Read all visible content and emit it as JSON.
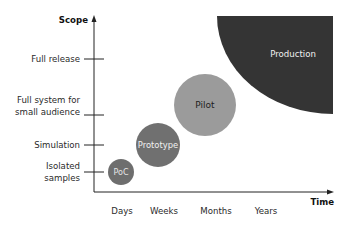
{
  "axes": {
    "y_label": "Scope",
    "x_label": "Time",
    "y_ticks": [
      {
        "label_lines": [
          "Full release"
        ],
        "y": 59
      },
      {
        "label_lines": [
          "Full system for",
          "small audience"
        ],
        "y": 115
      },
      {
        "label_lines": [
          "Simulation"
        ],
        "y": 145
      },
      {
        "label_lines": [
          "Isolated",
          "samples"
        ],
        "y": 172
      }
    ],
    "x_ticks": [
      {
        "label": "Days",
        "x": 122
      },
      {
        "label": "Weeks",
        "x": 164
      },
      {
        "label": "Months",
        "x": 216
      },
      {
        "label": "Years",
        "x": 266
      }
    ]
  },
  "stages": [
    {
      "name": "PoC",
      "cx": 121,
      "cy": 172,
      "r": 13,
      "fill": "#6e6e6e",
      "text_color": "#e6e6e6"
    },
    {
      "name": "Prototype",
      "cx": 158,
      "cy": 145,
      "r": 22,
      "fill": "#707070",
      "text_color": "#f2f2f2"
    },
    {
      "name": "Pilot",
      "cx": 205,
      "cy": 105,
      "r": 31,
      "fill": "#9b9b9b",
      "text_color": "#1e1e1e"
    },
    {
      "name": "Production",
      "fill": "#343434",
      "text_color": "#e8e8e8"
    }
  ],
  "labels": {
    "y_axis": "Scope",
    "x_axis": "Time",
    "tick_full_release": "Full release",
    "tick_full_system_1": "Full system for",
    "tick_full_system_2": "small audience",
    "tick_simulation": "Simulation",
    "tick_isolated_1": "Isolated",
    "tick_isolated_2": "samples",
    "x_days": "Days",
    "x_weeks": "Weeks",
    "x_months": "Months",
    "x_years": "Years",
    "poc": "PoC",
    "prototype": "Prototype",
    "pilot": "Pilot",
    "production": "Production"
  }
}
